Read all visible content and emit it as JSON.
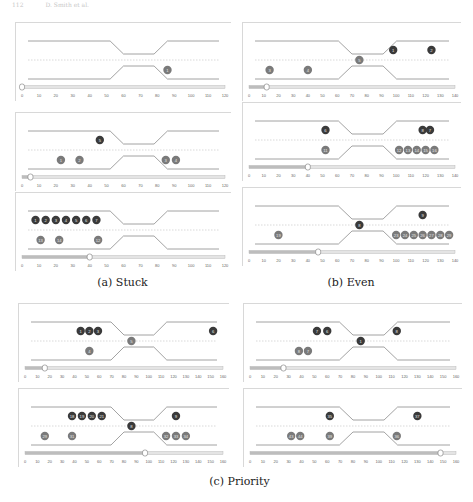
{
  "header": {
    "page_number": "112",
    "running_title": "D. Smith et al."
  },
  "captions": {
    "a": "(a) Stuck",
    "b": "(b) Even",
    "c": "(c) Priority"
  },
  "colors": {
    "dark_circle": "#3a3a3a",
    "gray_circle": "#7a7a7a",
    "line": "#8a8a8a",
    "dotted": "#c8c8c8",
    "slider": "#b0b0b0"
  },
  "panels": [
    {
      "id": "a1",
      "group": "a",
      "x": 15,
      "y": 22,
      "w": 215,
      "h": 78,
      "axis_max": 120,
      "ticks": [
        "0",
        "10",
        "20",
        "30",
        "40",
        "50",
        "60",
        "70",
        "80",
        "90",
        "100",
        "110",
        "120"
      ],
      "slider_value": 0,
      "circles": [
        {
          "x": 86,
          "lane": "low",
          "label": "1",
          "color": "gray"
        }
      ]
    },
    {
      "id": "a2",
      "group": "a",
      "x": 15,
      "y": 112,
      "w": 215,
      "h": 78,
      "axis_max": 120,
      "ticks": [
        "0",
        "10",
        "20",
        "30",
        "40",
        "50",
        "60",
        "70",
        "80",
        "90",
        "100",
        "110",
        "120"
      ],
      "slider_value": 5,
      "circles": [
        {
          "x": 46,
          "lane": "high",
          "label": "5",
          "color": "dark"
        },
        {
          "x": 23,
          "lane": "low",
          "label": "1",
          "color": "gray"
        },
        {
          "x": 34,
          "lane": "low",
          "label": "2",
          "color": "gray"
        },
        {
          "x": 85,
          "lane": "low",
          "label": "3",
          "color": "gray"
        },
        {
          "x": 91,
          "lane": "low",
          "label": "4",
          "color": "gray"
        }
      ]
    },
    {
      "id": "a3",
      "group": "a",
      "x": 15,
      "y": 192,
      "w": 215,
      "h": 78,
      "axis_max": 120,
      "ticks": [
        "0",
        "10",
        "20",
        "30",
        "40",
        "50",
        "60",
        "70",
        "80",
        "90",
        "100",
        "110",
        "120"
      ],
      "slider_value": 40,
      "circles": [
        {
          "x": 8,
          "lane": "high",
          "label": "1",
          "color": "dark"
        },
        {
          "x": 14,
          "lane": "high",
          "label": "2",
          "color": "dark"
        },
        {
          "x": 20,
          "lane": "high",
          "label": "3",
          "color": "dark"
        },
        {
          "x": 26,
          "lane": "high",
          "label": "4",
          "color": "dark"
        },
        {
          "x": 32,
          "lane": "high",
          "label": "5",
          "color": "dark"
        },
        {
          "x": 38,
          "lane": "high",
          "label": "6",
          "color": "dark"
        },
        {
          "x": 44,
          "lane": "high",
          "label": "7",
          "color": "dark"
        },
        {
          "x": 11,
          "lane": "low",
          "label": "13",
          "color": "gray"
        },
        {
          "x": 22,
          "lane": "low",
          "label": "14",
          "color": "gray"
        },
        {
          "x": 45,
          "lane": "low",
          "label": "12",
          "color": "gray"
        }
      ]
    },
    {
      "id": "b1",
      "group": "b",
      "x": 242,
      "y": 22,
      "w": 218,
      "h": 78,
      "axis_max": 140,
      "ticks": [
        "0",
        "10",
        "20",
        "30",
        "40",
        "50",
        "60",
        "70",
        "80",
        "90",
        "100",
        "110",
        "120",
        "130",
        "140"
      ],
      "slider_value": 12,
      "circles": [
        {
          "x": 98,
          "lane": "high",
          "label": "1",
          "color": "dark"
        },
        {
          "x": 124,
          "lane": "high",
          "label": "2",
          "color": "dark"
        },
        {
          "x": 75,
          "lane": "mid",
          "label": "5",
          "color": "gray"
        },
        {
          "x": 14,
          "lane": "low",
          "label": "3",
          "color": "gray"
        },
        {
          "x": 40,
          "lane": "low",
          "label": "4",
          "color": "gray"
        }
      ]
    },
    {
      "id": "b2",
      "group": "b",
      "x": 242,
      "y": 102,
      "w": 218,
      "h": 78,
      "axis_max": 140,
      "ticks": [
        "0",
        "10",
        "20",
        "30",
        "40",
        "50",
        "60",
        "70",
        "80",
        "90",
        "100",
        "110",
        "120",
        "130",
        "140"
      ],
      "slider_value": 40,
      "circles": [
        {
          "x": 52,
          "lane": "high",
          "label": "6",
          "color": "dark"
        },
        {
          "x": 118,
          "lane": "high",
          "label": "8",
          "color": "dark"
        },
        {
          "x": 123,
          "lane": "high",
          "label": "7",
          "color": "dark"
        },
        {
          "x": 52,
          "lane": "low",
          "label": "11",
          "color": "gray"
        },
        {
          "x": 102,
          "lane": "low",
          "label": "12",
          "color": "gray"
        },
        {
          "x": 108,
          "lane": "low",
          "label": "13",
          "color": "gray"
        },
        {
          "x": 114,
          "lane": "low",
          "label": "14",
          "color": "gray"
        },
        {
          "x": 120,
          "lane": "low",
          "label": "15",
          "color": "gray"
        },
        {
          "x": 126,
          "lane": "low",
          "label": "16",
          "color": "gray"
        }
      ]
    },
    {
      "id": "b3",
      "group": "b",
      "x": 242,
      "y": 187,
      "w": 218,
      "h": 78,
      "axis_max": 140,
      "ticks": [
        "0",
        "10",
        "20",
        "30",
        "40",
        "50",
        "60",
        "70",
        "80",
        "90",
        "100",
        "110",
        "120",
        "130",
        "140"
      ],
      "slider_value": 47,
      "circles": [
        {
          "x": 118,
          "lane": "high",
          "label": "9",
          "color": "dark"
        },
        {
          "x": 75,
          "lane": "mid",
          "label": "8",
          "color": "dark"
        },
        {
          "x": 20,
          "lane": "low",
          "label": "19",
          "color": "gray"
        },
        {
          "x": 100,
          "lane": "low",
          "label": "23",
          "color": "gray"
        },
        {
          "x": 106,
          "lane": "low",
          "label": "24",
          "color": "gray"
        },
        {
          "x": 112,
          "lane": "low",
          "label": "25",
          "color": "gray"
        },
        {
          "x": 118,
          "lane": "low",
          "label": "26",
          "color": "gray"
        },
        {
          "x": 124,
          "lane": "low",
          "label": "27",
          "color": "gray"
        },
        {
          "x": 130,
          "lane": "low",
          "label": "28",
          "color": "gray"
        },
        {
          "x": 136,
          "lane": "low",
          "label": "29",
          "color": "gray"
        }
      ]
    },
    {
      "id": "c1",
      "group": "c",
      "x": 18,
      "y": 303,
      "w": 210,
      "h": 78,
      "axis_max": 160,
      "ticks": [
        "0",
        "10",
        "20",
        "30",
        "40",
        "50",
        "60",
        "70",
        "80",
        "90",
        "100",
        "110",
        "120",
        "130",
        "140",
        "150",
        "160"
      ],
      "slider_value": 16,
      "circles": [
        {
          "x": 45,
          "lane": "high",
          "label": "1",
          "color": "dark"
        },
        {
          "x": 52,
          "lane": "high",
          "label": "2",
          "color": "dark"
        },
        {
          "x": 59,
          "lane": "high",
          "label": "3",
          "color": "dark"
        },
        {
          "x": 152,
          "lane": "high",
          "label": "6",
          "color": "dark"
        },
        {
          "x": 86,
          "lane": "mid",
          "label": "5",
          "color": "gray"
        },
        {
          "x": 52,
          "lane": "low",
          "label": "4",
          "color": "gray"
        }
      ]
    },
    {
      "id": "c2",
      "group": "c",
      "x": 243,
      "y": 303,
      "w": 218,
      "h": 78,
      "axis_max": 160,
      "ticks": [
        "0",
        "10",
        "20",
        "30",
        "40",
        "50",
        "60",
        "70",
        "80",
        "90",
        "100",
        "110",
        "120",
        "130",
        "140",
        "150",
        "160"
      ],
      "slider_value": 26,
      "circles": [
        {
          "x": 52,
          "lane": "high",
          "label": "7",
          "color": "dark"
        },
        {
          "x": 60,
          "lane": "high",
          "label": "6",
          "color": "dark"
        },
        {
          "x": 114,
          "lane": "high",
          "label": "8",
          "color": "dark"
        },
        {
          "x": 86,
          "lane": "mid",
          "label": "1",
          "color": "dark"
        },
        {
          "x": 38,
          "lane": "low",
          "label": "8",
          "color": "gray"
        },
        {
          "x": 45,
          "lane": "low",
          "label": "7",
          "color": "gray"
        }
      ]
    },
    {
      "id": "c3",
      "group": "c",
      "x": 18,
      "y": 388,
      "w": 210,
      "h": 78,
      "axis_max": 160,
      "ticks": [
        "0",
        "10",
        "20",
        "30",
        "40",
        "50",
        "60",
        "70",
        "80",
        "90",
        "100",
        "110",
        "120",
        "130",
        "140",
        "150",
        "160"
      ],
      "slider_value": 97,
      "circles": [
        {
          "x": 38,
          "lane": "high",
          "label": "18",
          "color": "dark"
        },
        {
          "x": 46,
          "lane": "high",
          "label": "19",
          "color": "dark"
        },
        {
          "x": 54,
          "lane": "high",
          "label": "20",
          "color": "dark"
        },
        {
          "x": 62,
          "lane": "high",
          "label": "21",
          "color": "dark"
        },
        {
          "x": 122,
          "lane": "high",
          "label": "9",
          "color": "dark"
        },
        {
          "x": 86,
          "lane": "mid",
          "label": "8",
          "color": "dark"
        },
        {
          "x": 16,
          "lane": "low",
          "label": "29",
          "color": "gray"
        },
        {
          "x": 38,
          "lane": "low",
          "label": "31",
          "color": "gray"
        },
        {
          "x": 114,
          "lane": "low",
          "label": "32",
          "color": "gray"
        },
        {
          "x": 122,
          "lane": "low",
          "label": "33",
          "color": "gray"
        },
        {
          "x": 130,
          "lane": "low",
          "label": "34",
          "color": "gray"
        }
      ]
    },
    {
      "id": "c4",
      "group": "c",
      "x": 243,
      "y": 388,
      "w": 218,
      "h": 78,
      "axis_max": 160,
      "ticks": [
        "0",
        "10",
        "20",
        "30",
        "40",
        "50",
        "60",
        "70",
        "80",
        "90",
        "100",
        "110",
        "120",
        "130",
        "140",
        "150",
        "160"
      ],
      "slider_value": 148,
      "circles": [
        {
          "x": 62,
          "lane": "high",
          "label": "35",
          "color": "dark"
        },
        {
          "x": 130,
          "lane": "high",
          "label": "37",
          "color": "dark"
        },
        {
          "x": 32,
          "lane": "low",
          "label": "43",
          "color": "gray"
        },
        {
          "x": 39,
          "lane": "low",
          "label": "44",
          "color": "gray"
        },
        {
          "x": 62,
          "lane": "low",
          "label": "39",
          "color": "gray"
        },
        {
          "x": 114,
          "lane": "low",
          "label": "36",
          "color": "gray"
        }
      ]
    }
  ]
}
